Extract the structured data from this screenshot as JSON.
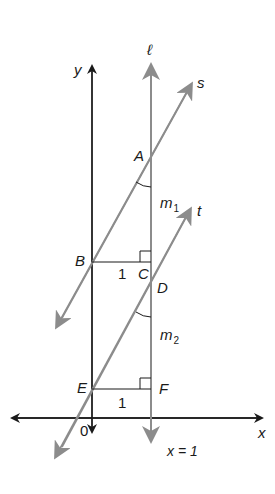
{
  "figure": {
    "type": "coordinate-geometry-diagram",
    "colors": {
      "axes": "#1a1a1a",
      "lines": "#8c8c8c",
      "background": "#ffffff"
    },
    "axes": {
      "x_label": "x",
      "y_label": "y",
      "origin_label": "0"
    },
    "lines": [
      {
        "name": "ℓ",
        "equation_label": "x = 1"
      },
      {
        "name": "s"
      },
      {
        "name": "t"
      }
    ],
    "points": [
      "A",
      "B",
      "C",
      "D",
      "E",
      "F"
    ],
    "segment_labels": {
      "BC": "1",
      "EF": "1"
    },
    "angle_labels": {
      "at_A": "m",
      "at_A_sub": "1",
      "at_D": "m",
      "at_D_sub": "2"
    }
  },
  "labels": {
    "y": "y",
    "x": "x",
    "ell": "ℓ",
    "s": "s",
    "t": "t",
    "A": "A",
    "B": "B",
    "C": "C",
    "D": "D",
    "E": "E",
    "F": "F",
    "one_bc": "1",
    "one_ef": "1",
    "zero": "0",
    "m": "m",
    "sub1": "1",
    "sub2": "2",
    "x_eq": "x = 1"
  }
}
